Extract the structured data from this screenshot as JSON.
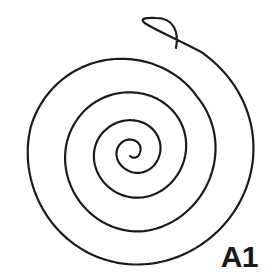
{
  "figure": {
    "kind": "spiral-line-drawing",
    "label": "A1",
    "background_color": "#ffffff",
    "stroke_color": "#1a1a1a",
    "stroke_width": 2.2,
    "canvas": {
      "width": 276,
      "height": 280
    }
  },
  "chart_data": {
    "type": "line",
    "title": "A1",
    "xlabel": "",
    "ylabel": "",
    "grid": false,
    "legend": null,
    "center": {
      "x": 133,
      "y": 152
    },
    "turns": 4.5,
    "direction": "counter-clockwise-inward",
    "bounds": {
      "left": 18,
      "right": 256,
      "top": 18,
      "bottom": 257
    },
    "left_axis_crossings_x": [
      19,
      48,
      68,
      88,
      105,
      119,
      128
    ],
    "right_axis_crossings_x": [
      140,
      152,
      168,
      188,
      212,
      238,
      256
    ],
    "outer_terminus": {
      "x": 176,
      "y": 48,
      "cap": "round"
    },
    "inner_terminus": {
      "x": 139,
      "y": 158,
      "cap": "round"
    }
  },
  "annotations": {
    "label_text": "A1",
    "label_position": "bottom-right"
  }
}
